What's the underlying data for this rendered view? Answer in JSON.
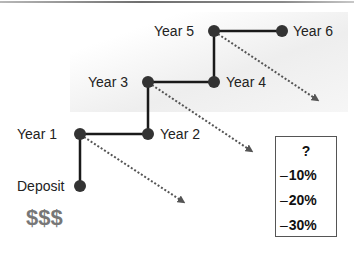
{
  "diagram": {
    "nodes": [
      {
        "id": "deposit",
        "label": "Deposit",
        "x": 80,
        "y": 186
      },
      {
        "id": "year1",
        "label": "Year 1",
        "x": 80,
        "y": 134
      },
      {
        "id": "year2",
        "label": "Year 2",
        "x": 148,
        "y": 134
      },
      {
        "id": "year3",
        "label": "Year 3",
        "x": 148,
        "y": 82
      },
      {
        "id": "year4",
        "label": "Year 4",
        "x": 214,
        "y": 82
      },
      {
        "id": "year5",
        "label": "Year 5",
        "x": 214,
        "y": 31
      },
      {
        "id": "year6",
        "label": "Year 6",
        "x": 282,
        "y": 31
      }
    ],
    "path": "deposit → year1 → year2 → year3 → year4 → year5 → year6",
    "dotted_arrows_from": [
      "year1",
      "year3",
      "year5"
    ],
    "money_symbol": "$$$",
    "loss_box": {
      "title": "?",
      "items": [
        {
          "sign": "–",
          "value": "10%"
        },
        {
          "sign": "–",
          "value": "20%"
        },
        {
          "sign": "–",
          "value": "30%"
        }
      ]
    },
    "colors": {
      "node": "#333333",
      "line": "#1a1a1a",
      "dotted": "#555555",
      "money": "#777777"
    }
  }
}
